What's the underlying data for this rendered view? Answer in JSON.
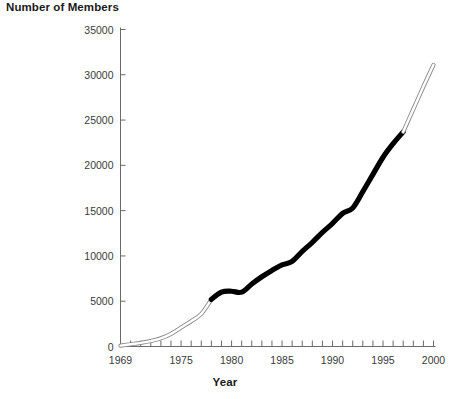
{
  "chart_data": {
    "type": "line",
    "title": "",
    "ylabel": "Number of Members",
    "xlabel": "Year",
    "xlim": [
      1969,
      2000
    ],
    "ylim": [
      0,
      35000
    ],
    "y_ticks": [
      0,
      5000,
      10000,
      15000,
      20000,
      25000,
      30000,
      35000
    ],
    "y_tick_labels": [
      "0",
      "5000",
      "10000",
      "15000",
      "20000",
      "25000",
      "30000",
      "35000"
    ],
    "x_ticks_minor_step": 1,
    "x_tick_labels": [
      "1969",
      "1975",
      "1980",
      "1985",
      "1990",
      "1995",
      "2000"
    ],
    "x_tick_label_years": [
      1969,
      1975,
      1980,
      1985,
      1990,
      1995,
      2000
    ],
    "grid": false,
    "legend": "none",
    "line_colors": {
      "actual": "#000000",
      "projected_outline": "#8a8a8a",
      "projected_fill": "#ffffff"
    },
    "series": [
      {
        "name": "Members (early / outlined)",
        "style": "outlined-white",
        "x": [
          1969,
          1970,
          1971,
          1972,
          1973,
          1974,
          1975,
          1976,
          1977,
          1978
        ],
        "values": [
          100,
          250,
          400,
          600,
          900,
          1400,
          2100,
          2800,
          3600,
          5200
        ]
      },
      {
        "name": "Members (actual / solid black)",
        "style": "solid-black",
        "x": [
          1978,
          1979,
          1980,
          1981,
          1982,
          1983,
          1984,
          1985,
          1986,
          1987,
          1988,
          1989,
          1990,
          1991,
          1992,
          1993,
          1994,
          1995,
          1996,
          1997
        ],
        "values": [
          5200,
          6000,
          6100,
          6000,
          6900,
          7700,
          8400,
          9000,
          9400,
          10500,
          11500,
          12600,
          13600,
          14700,
          15300,
          17100,
          19000,
          20900,
          22400,
          23700
        ]
      },
      {
        "name": "Members (projected / outlined)",
        "style": "outlined-white",
        "x": [
          1997,
          1998,
          1999,
          2000
        ],
        "values": [
          23700,
          26200,
          28700,
          31100
        ]
      }
    ]
  },
  "labels": {
    "y_axis_title": "Number of Members",
    "x_axis_title": "Year"
  }
}
